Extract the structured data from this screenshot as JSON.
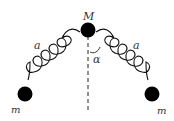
{
  "diagram": {
    "labels": {
      "top_mass": "M",
      "left_mass": "m",
      "right_mass": "m",
      "left_spring": "a",
      "right_spring": "a",
      "angle": "α"
    },
    "colors": {
      "mass": "#000000",
      "spring": "#111111",
      "text": "#333333"
    }
  }
}
